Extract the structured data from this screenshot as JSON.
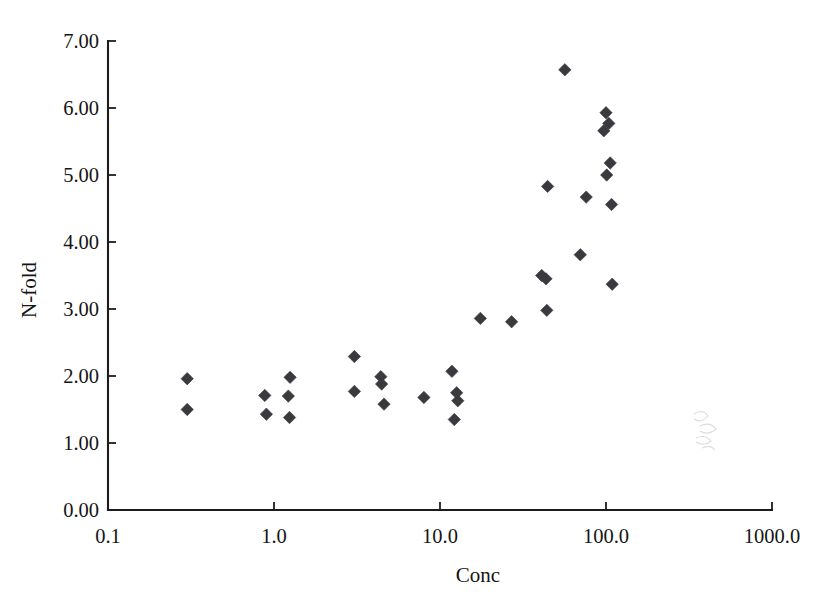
{
  "chart_data": {
    "type": "scatter",
    "title": "",
    "xlabel": "Conc",
    "ylabel": "N-fold",
    "xscale": "log",
    "yscale": "linear",
    "xlim": [
      0.1,
      1000.0
    ],
    "ylim": [
      0.0,
      7.0
    ],
    "grid": false,
    "legend": null,
    "x_tick_labels": [
      "0.1",
      "1.0",
      "10.0",
      "100.0",
      "1000.0"
    ],
    "x_tick_values": [
      0.1,
      1.0,
      10.0,
      100.0,
      1000.0
    ],
    "y_tick_labels": [
      "0.00",
      "1.00",
      "2.00",
      "3.00",
      "4.00",
      "5.00",
      "6.00",
      "7.00"
    ],
    "y_tick_values": [
      0.0,
      1.0,
      2.0,
      3.0,
      4.0,
      5.0,
      6.0,
      7.0
    ],
    "marker_style": "filled-diamond",
    "marker_color": "#3a3a3e",
    "n_points": 31,
    "points": [
      {
        "x": 0.3,
        "y": 1.96
      },
      {
        "x": 0.3,
        "y": 1.5
      },
      {
        "x": 0.88,
        "y": 1.71
      },
      {
        "x": 0.9,
        "y": 1.43
      },
      {
        "x": 1.25,
        "y": 1.98
      },
      {
        "x": 1.22,
        "y": 1.7
      },
      {
        "x": 1.24,
        "y": 1.38
      },
      {
        "x": 3.05,
        "y": 2.29
      },
      {
        "x": 3.05,
        "y": 1.77
      },
      {
        "x": 4.4,
        "y": 1.99
      },
      {
        "x": 4.45,
        "y": 1.88
      },
      {
        "x": 4.6,
        "y": 1.58
      },
      {
        "x": 8.0,
        "y": 1.68
      },
      {
        "x": 11.8,
        "y": 2.07
      },
      {
        "x": 12.6,
        "y": 1.75
      },
      {
        "x": 12.8,
        "y": 1.63
      },
      {
        "x": 12.2,
        "y": 1.35
      },
      {
        "x": 17.5,
        "y": 2.86
      },
      {
        "x": 27.0,
        "y": 2.81
      },
      {
        "x": 41.0,
        "y": 3.5
      },
      {
        "x": 43.5,
        "y": 3.45
      },
      {
        "x": 44.0,
        "y": 2.98
      },
      {
        "x": 44.5,
        "y": 4.83
      },
      {
        "x": 56.5,
        "y": 6.57
      },
      {
        "x": 70.0,
        "y": 3.81
      },
      {
        "x": 76.0,
        "y": 4.67
      },
      {
        "x": 100.0,
        "y": 5.93
      },
      {
        "x": 104.0,
        "y": 5.77
      },
      {
        "x": 97.0,
        "y": 5.66
      },
      {
        "x": 106.0,
        "y": 5.18
      },
      {
        "x": 101.0,
        "y": 5.0
      },
      {
        "x": 108.0,
        "y": 4.56
      },
      {
        "x": 109.0,
        "y": 3.37
      }
    ]
  },
  "axes": {
    "x_title": "Conc",
    "y_title": "N-fold"
  }
}
